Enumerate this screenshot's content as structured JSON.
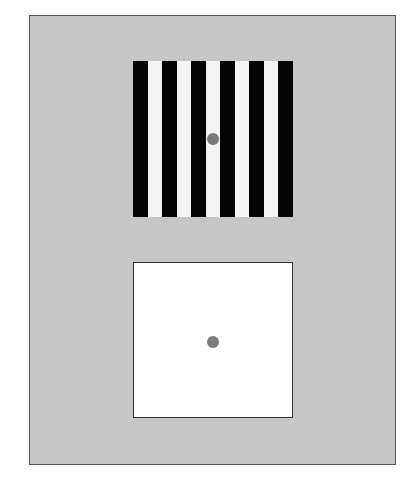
{
  "figure": {
    "background_color": "#c6c6c6",
    "border_color": "#555555",
    "top_stimulus": {
      "type": "square-wave grating",
      "orientation": "vertical",
      "stripe_count": 11,
      "stripe_pattern": [
        "black",
        "white",
        "black",
        "white",
        "black",
        "white",
        "black",
        "white",
        "black",
        "white",
        "black"
      ],
      "colors": {
        "black": "#050505",
        "white": "#f4f4f4"
      },
      "fixation_dot_color": "#7a7a7a"
    },
    "bottom_stimulus": {
      "type": "uniform field",
      "fill_color": "#ffffff",
      "fixation_dot_color": "#7a7a7a"
    }
  }
}
